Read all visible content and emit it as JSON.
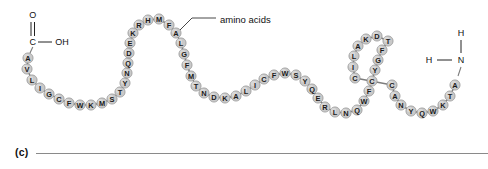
{
  "figure": {
    "panel_label": "(c)",
    "callout_label": "amino acids",
    "residue_fill": "#c9c9c9",
    "residue_stroke": "#8f8f8f",
    "bond_color": "#7d7d7d",
    "text_color": "#1a1a1a",
    "rule_color": "#8a8a8a"
  },
  "c_terminus": {
    "oxygen_label": "O",
    "carbon_label": "C",
    "hydroxyl_label": "OH"
  },
  "n_terminus": {
    "hydrogen_top_label": "H",
    "hydrogen_left_label": "H",
    "nitrogen_label": "N"
  },
  "chain": {
    "sequence": "AVLIGCFWKMSTYNQDEKRHMFALGFMTNDKALICFWSYQERLNQWFCYGFTDKALICCANYQWKTA",
    "residues": [
      {
        "letter": "A",
        "x": 28,
        "y": 58
      },
      {
        "letter": "V",
        "x": 27,
        "y": 69
      },
      {
        "letter": "L",
        "x": 32,
        "y": 80
      },
      {
        "letter": "I",
        "x": 40,
        "y": 88
      },
      {
        "letter": "G",
        "x": 49,
        "y": 94
      },
      {
        "letter": "C",
        "x": 59,
        "y": 99
      },
      {
        "letter": "F",
        "x": 69,
        "y": 103
      },
      {
        "letter": "W",
        "x": 80,
        "y": 105
      },
      {
        "letter": "K",
        "x": 91,
        "y": 105
      },
      {
        "letter": "M",
        "x": 102,
        "y": 103
      },
      {
        "letter": "S",
        "x": 112,
        "y": 99
      },
      {
        "letter": "T",
        "x": 120,
        "y": 92
      },
      {
        "letter": "Y",
        "x": 125,
        "y": 83
      },
      {
        "letter": "N",
        "x": 127,
        "y": 73
      },
      {
        "letter": "Q",
        "x": 128,
        "y": 63
      },
      {
        "letter": "D",
        "x": 129,
        "y": 53
      },
      {
        "letter": "E",
        "x": 130,
        "y": 43
      },
      {
        "letter": "K",
        "x": 133,
        "y": 33
      },
      {
        "letter": "R",
        "x": 139,
        "y": 25
      },
      {
        "letter": "H",
        "x": 148,
        "y": 20
      },
      {
        "letter": "M",
        "x": 159,
        "y": 19
      },
      {
        "letter": "F",
        "x": 169,
        "y": 25
      },
      {
        "letter": "A",
        "x": 176,
        "y": 33
      },
      {
        "letter": "L",
        "x": 181,
        "y": 43
      },
      {
        "letter": "G",
        "x": 184,
        "y": 54
      },
      {
        "letter": "F",
        "x": 187,
        "y": 65
      },
      {
        "letter": "M",
        "x": 191,
        "y": 76
      },
      {
        "letter": "T",
        "x": 196,
        "y": 86
      },
      {
        "letter": "N",
        "x": 204,
        "y": 93
      },
      {
        "letter": "D",
        "x": 214,
        "y": 97
      },
      {
        "letter": "K",
        "x": 225,
        "y": 98
      },
      {
        "letter": "A",
        "x": 236,
        "y": 96
      },
      {
        "letter": "L",
        "x": 246,
        "y": 91
      },
      {
        "letter": "I",
        "x": 255,
        "y": 85
      },
      {
        "letter": "C",
        "x": 264,
        "y": 79
      },
      {
        "letter": "F",
        "x": 274,
        "y": 75
      },
      {
        "letter": "W",
        "x": 285,
        "y": 73
      },
      {
        "letter": "S",
        "x": 296,
        "y": 75
      },
      {
        "letter": "Y",
        "x": 305,
        "y": 81
      },
      {
        "letter": "Q",
        "x": 312,
        "y": 89
      },
      {
        "letter": "E",
        "x": 318,
        "y": 98
      },
      {
        "letter": "R",
        "x": 325,
        "y": 107
      },
      {
        "letter": "L",
        "x": 335,
        "y": 112
      },
      {
        "letter": "N",
        "x": 346,
        "y": 113
      },
      {
        "letter": "Q",
        "x": 357,
        "y": 110
      },
      {
        "letter": "W",
        "x": 364,
        "y": 101
      },
      {
        "letter": "F",
        "x": 369,
        "y": 91
      },
      {
        "letter": "C",
        "x": 372,
        "y": 81
      },
      {
        "letter": "Y",
        "x": 375,
        "y": 70
      },
      {
        "letter": "G",
        "x": 378,
        "y": 60
      },
      {
        "letter": "F",
        "x": 382,
        "y": 50
      },
      {
        "letter": "T",
        "x": 388,
        "y": 41
      },
      {
        "letter": "D",
        "x": 377,
        "y": 36
      },
      {
        "letter": "K",
        "x": 366,
        "y": 39
      },
      {
        "letter": "A",
        "x": 358,
        "y": 46
      },
      {
        "letter": "L",
        "x": 354,
        "y": 56
      },
      {
        "letter": "I",
        "x": 353,
        "y": 67
      },
      {
        "letter": "C",
        "x": 355,
        "y": 78
      },
      {
        "letter": "C",
        "x": 392,
        "y": 85
      },
      {
        "letter": "A",
        "x": 395,
        "y": 96
      },
      {
        "letter": "N",
        "x": 401,
        "y": 105
      },
      {
        "letter": "Y",
        "x": 411,
        "y": 111
      },
      {
        "letter": "Q",
        "x": 422,
        "y": 113
      },
      {
        "letter": "W",
        "x": 433,
        "y": 111
      },
      {
        "letter": "K",
        "x": 443,
        "y": 105
      },
      {
        "letter": "T",
        "x": 450,
        "y": 96
      },
      {
        "letter": "A",
        "x": 455,
        "y": 85
      }
    ]
  }
}
